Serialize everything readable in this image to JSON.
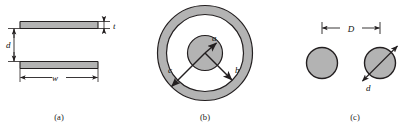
{
  "figure": {
    "stroke_color": "#231f20",
    "fill_color": "#b3b3b3",
    "background": "#ffffff"
  },
  "panels": [
    {
      "id": "parallel-plate",
      "caption": "(a)",
      "labels": {
        "thickness": "t",
        "separation": "d",
        "width": "w"
      }
    },
    {
      "id": "coaxial",
      "caption": "(b)",
      "labels": {
        "inner_radius": "a",
        "shield_inner_radius": "b",
        "shield_outer_radius": "c"
      }
    },
    {
      "id": "two-wire",
      "caption": "(c)",
      "labels": {
        "spacing": "D",
        "diameter": "d"
      }
    }
  ]
}
